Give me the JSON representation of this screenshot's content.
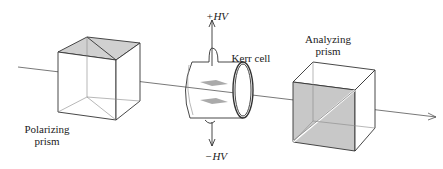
{
  "diagram": {
    "labels": {
      "polarizer_line1": "Polarizing",
      "polarizer_line2": "prism",
      "kerr": "Kerr cell",
      "plus_hv": "+HV",
      "minus_hv": "−HV",
      "analyzer_line1": "Analyzing",
      "analyzer_line2": "prism"
    },
    "colors": {
      "line": "#333333",
      "shade": "#c8c8c8",
      "plate": "#aaaaaa"
    }
  }
}
